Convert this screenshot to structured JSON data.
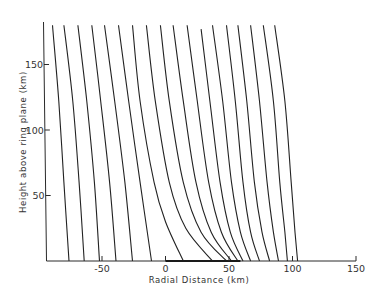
{
  "chart_data": {
    "type": "line",
    "title": "",
    "xlabel": "Radial Distance (km)",
    "ylabel": "Height above ring plane (km)",
    "xlim": [
      -95,
      150
    ],
    "ylim": [
      0,
      182
    ],
    "grid": false,
    "legend": null,
    "x_ticks": [
      -50,
      0,
      50,
      100,
      150
    ],
    "x_tick_labels": [
      "-50",
      "0",
      "50",
      "100",
      "150"
    ],
    "y_ticks": [
      50,
      100,
      150
    ],
    "y_tick_labels": [
      "50",
      "100",
      "150"
    ],
    "annotations": [
      {
        "type": "ring-segment",
        "x_start": 0,
        "x_end": 59,
        "y": 0,
        "description": "thick segment on x-axis representing the ring"
      }
    ],
    "series": [
      {
        "name": "field-line-1",
        "points": [
          [
            -89,
            180
          ],
          [
            -84,
            122
          ],
          [
            -80,
            60
          ],
          [
            -76,
            0
          ]
        ]
      },
      {
        "name": "field-line-2",
        "points": [
          [
            -80,
            180
          ],
          [
            -73,
            122
          ],
          [
            -68,
            60
          ],
          [
            -64,
            0
          ]
        ]
      },
      {
        "name": "field-line-3",
        "points": [
          [
            -69,
            180
          ],
          [
            -62,
            122
          ],
          [
            -56,
            60
          ],
          [
            -52,
            0
          ]
        ]
      },
      {
        "name": "field-line-4",
        "points": [
          [
            -58,
            180
          ],
          [
            -51,
            122
          ],
          [
            -44,
            60
          ],
          [
            -39,
            0
          ]
        ]
      },
      {
        "name": "field-line-5",
        "points": [
          [
            -48,
            180
          ],
          [
            -40,
            122
          ],
          [
            -32,
            60
          ],
          [
            -26,
            0
          ]
        ]
      },
      {
        "name": "field-line-6",
        "points": [
          [
            -37,
            180
          ],
          [
            -29,
            122
          ],
          [
            -20,
            60
          ],
          [
            -11,
            0
          ]
        ]
      },
      {
        "name": "field-line-7",
        "points": [
          [
            -26,
            180
          ],
          [
            -20,
            122
          ],
          [
            -9,
            60
          ],
          [
            0,
            30
          ],
          [
            14,
            0
          ]
        ]
      },
      {
        "name": "field-line-8",
        "points": [
          [
            -15,
            180
          ],
          [
            -8,
            122
          ],
          [
            3,
            60
          ],
          [
            16,
            25
          ],
          [
            37,
            0
          ]
        ]
      },
      {
        "name": "field-line-9",
        "points": [
          [
            -4,
            180
          ],
          [
            3,
            122
          ],
          [
            14,
            60
          ],
          [
            28,
            22
          ],
          [
            48,
            0
          ]
        ]
      },
      {
        "name": "field-line-10",
        "points": [
          [
            6,
            180
          ],
          [
            14,
            122
          ],
          [
            24,
            60
          ],
          [
            36,
            22
          ],
          [
            52,
            0
          ]
        ]
      },
      {
        "name": "field-line-11",
        "points": [
          [
            17,
            180
          ],
          [
            25,
            122
          ],
          [
            34,
            60
          ],
          [
            44,
            22
          ],
          [
            57,
            0
          ]
        ]
      },
      {
        "name": "field-line-12",
        "points": [
          [
            28,
            177
          ],
          [
            35,
            122
          ],
          [
            43,
            60
          ],
          [
            51,
            22
          ],
          [
            61,
            0
          ]
        ]
      },
      {
        "name": "field-line-13",
        "points": [
          [
            37,
            180
          ],
          [
            45,
            122
          ],
          [
            52,
            60
          ],
          [
            59,
            22
          ],
          [
            67,
            0
          ]
        ]
      },
      {
        "name": "field-line-14",
        "points": [
          [
            48,
            180
          ],
          [
            55,
            122
          ],
          [
            61,
            60
          ],
          [
            67,
            22
          ],
          [
            74,
            0
          ]
        ]
      },
      {
        "name": "field-line-15",
        "points": [
          [
            57,
            180
          ],
          [
            64,
            122
          ],
          [
            70,
            60
          ],
          [
            76,
            22
          ],
          [
            82,
            0
          ]
        ]
      },
      {
        "name": "field-line-16",
        "points": [
          [
            67,
            180
          ],
          [
            74,
            122
          ],
          [
            80,
            60
          ],
          [
            85,
            22
          ],
          [
            89,
            0
          ]
        ]
      },
      {
        "name": "field-line-17",
        "points": [
          [
            77,
            180
          ],
          [
            85,
            122
          ],
          [
            90,
            60
          ],
          [
            94,
            22
          ],
          [
            96,
            0
          ]
        ]
      },
      {
        "name": "field-line-18",
        "points": [
          [
            86,
            180
          ],
          [
            94,
            122
          ],
          [
            99,
            60
          ],
          [
            102,
            22
          ],
          [
            104,
            0
          ]
        ]
      }
    ]
  }
}
